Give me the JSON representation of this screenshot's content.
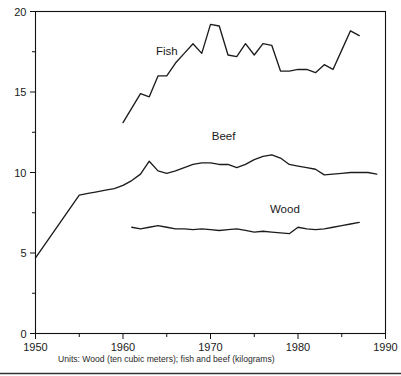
{
  "chart_data": {
    "type": "line",
    "title": "",
    "subtitle": "",
    "caption": "Units: Wood (ten cubic meters); fish and beef (kilograms)",
    "xlabel": "",
    "ylabel": "",
    "xlim": [
      1950,
      1990
    ],
    "ylim": [
      0,
      20
    ],
    "grid": false,
    "legend_position": "inline-labels",
    "x_ticks": [
      1950,
      1960,
      1970,
      1980,
      1990
    ],
    "x_tick_labels": [
      "1950",
      "1960",
      "1970",
      "1980",
      "1990"
    ],
    "x_minor_ticks": [
      1955,
      1965,
      1975,
      1985
    ],
    "y_ticks": [
      0,
      5,
      10,
      15,
      20
    ],
    "y_tick_labels": [
      "0",
      "5",
      "10",
      "15",
      "20"
    ],
    "y_minor_ticks": [
      2.5,
      7.5,
      12.5,
      17.5
    ],
    "series": [
      {
        "name": "Fish",
        "label": "Fish",
        "label_x": 1965.0,
        "label_y": 17.3,
        "x": [
          1960,
          1961,
          1962,
          1963,
          1964,
          1965,
          1966,
          1967,
          1968,
          1969,
          1970,
          1971,
          1972,
          1973,
          1974,
          1975,
          1976,
          1977,
          1978,
          1979,
          1980,
          1981,
          1982,
          1983,
          1984,
          1985,
          1986,
          1987
        ],
        "values": [
          13.1,
          14.0,
          14.9,
          14.7,
          16.0,
          16.0,
          16.8,
          17.4,
          18.0,
          17.4,
          19.2,
          19.1,
          17.3,
          17.2,
          18.0,
          17.3,
          18.0,
          17.9,
          16.3,
          16.3,
          16.4,
          16.4,
          16.2,
          16.7,
          16.4,
          17.6,
          18.8,
          18.5
        ]
      },
      {
        "name": "Beef",
        "label": "Beef",
        "label_x": 1971.5,
        "label_y": 12.0,
        "x": [
          1950,
          1955,
          1956,
          1957,
          1958,
          1959,
          1960,
          1961,
          1962,
          1963,
          1964,
          1965,
          1966,
          1967,
          1968,
          1969,
          1970,
          1971,
          1972,
          1973,
          1974,
          1975,
          1976,
          1977,
          1978,
          1979,
          1980,
          1981,
          1982,
          1983,
          1984,
          1985,
          1986,
          1987,
          1988,
          1989
        ],
        "values": [
          4.7,
          8.6,
          8.7,
          8.8,
          8.9,
          9.0,
          9.2,
          9.5,
          9.9,
          10.7,
          10.1,
          9.95,
          10.1,
          10.3,
          10.5,
          10.6,
          10.6,
          10.5,
          10.5,
          10.3,
          10.5,
          10.8,
          11.0,
          11.1,
          10.9,
          10.5,
          10.4,
          10.3,
          10.2,
          9.85,
          9.9,
          9.95,
          10.0,
          10.0,
          10.0,
          9.9
        ]
      },
      {
        "name": "Wood",
        "label": "Wood",
        "label_x": 1978.5,
        "label_y": 7.5,
        "x": [
          1961,
          1962,
          1963,
          1964,
          1965,
          1966,
          1967,
          1968,
          1969,
          1970,
          1971,
          1972,
          1973,
          1974,
          1975,
          1976,
          1977,
          1978,
          1979,
          1980,
          1981,
          1982,
          1983,
          1984,
          1985,
          1986,
          1987
        ],
        "values": [
          6.6,
          6.5,
          6.6,
          6.7,
          6.6,
          6.5,
          6.5,
          6.45,
          6.5,
          6.45,
          6.4,
          6.45,
          6.5,
          6.4,
          6.3,
          6.35,
          6.3,
          6.25,
          6.2,
          6.6,
          6.5,
          6.45,
          6.5,
          6.6,
          6.7,
          6.8,
          6.9
        ]
      }
    ]
  },
  "colors": {
    "line": "#1c1c1c",
    "axis": "#111111",
    "text": "#1a1a1a",
    "background": "#ffffff"
  }
}
